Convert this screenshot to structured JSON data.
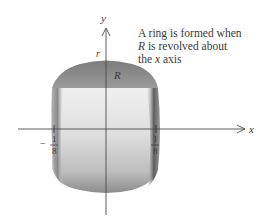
{
  "figure": {
    "caption_lines": [
      {
        "pre": "A ring is formed when",
        "var": "",
        "post": ""
      },
      {
        "pre": "",
        "var": "R",
        "post": " is revolved about"
      },
      {
        "pre": "the ",
        "var": "x",
        "post": " axis"
      }
    ],
    "axes": {
      "x_label": "x",
      "y_label": "y"
    },
    "labels": {
      "radius": "r",
      "region": "R"
    },
    "ticks": [
      {
        "sign": "−",
        "numerator": "1",
        "denominator": "8",
        "value": -0.125
      },
      {
        "sign": "",
        "numerator": "1",
        "denominator": "8",
        "value": 0.125
      }
    ],
    "colors": {
      "region_fill": "#8a8a8a",
      "band_light": "#e6e6e6",
      "shadow": "#6a6a6a",
      "axis": "#4a4a4a"
    }
  }
}
